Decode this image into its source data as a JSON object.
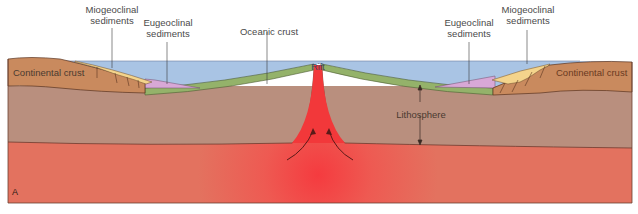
{
  "diagram": {
    "panel_letter": "A",
    "labels": {
      "miogeoclinal_left": "Miogeoclinal\nsediments",
      "eugeoclinal_left": "Eugeoclinal\nsediments",
      "oceanic_crust": "Oceanic crust",
      "rift": "Rift",
      "eugeoclinal_right": "Eugeoclinal\nsediments",
      "miogeoclinal_right": "Miogeoclinal\nsediments",
      "continental_crust_left": "Continental crust",
      "continental_crust_right": "Continental crust",
      "lithosphere": "Lithosphere"
    },
    "layers": [
      {
        "name": "Ocean water",
        "color": "#a9c4e4"
      },
      {
        "name": "Continental crust",
        "color": "#c98a5e"
      },
      {
        "name": "Miogeoclinal sediments",
        "color": "#f3d28a"
      },
      {
        "name": "Eugeoclinal sediments",
        "color": "#d9a9d6"
      },
      {
        "name": "Oceanic crust",
        "color": "#93b06b"
      },
      {
        "name": "Lithosphere",
        "color": "#b88f7f"
      },
      {
        "name": "Asthenosphere",
        "color": "#e8705f"
      },
      {
        "name": "Rising magma",
        "color": "#f2383a"
      }
    ],
    "annotations": {
      "convection_arrows": 2,
      "lithosphere_thickness_arrow": true
    }
  }
}
